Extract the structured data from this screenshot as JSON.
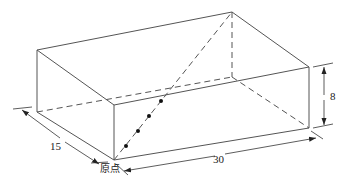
{
  "diagram": {
    "type": "box-3d-dimensions",
    "stroke_color": "#555555",
    "dimensions": {
      "length": "30",
      "width": "15",
      "height": "8"
    },
    "origin_label": "原点",
    "diagonal": {
      "from": "origin",
      "to": "top-back-right-corner",
      "style": "dashed with dots"
    }
  }
}
